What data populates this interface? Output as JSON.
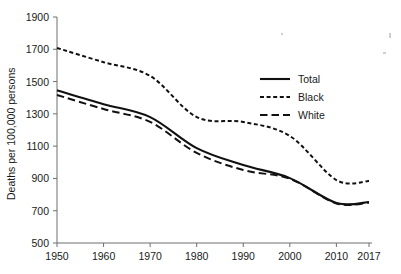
{
  "chart_data": {
    "type": "line",
    "title": "",
    "subtitle": "",
    "xlabel": "",
    "ylabel": "Deaths per 100,000 persons",
    "x": [
      1950,
      1960,
      1970,
      1980,
      1990,
      2000,
      2010,
      2017
    ],
    "xtick_labels": [
      "1950",
      "1960",
      "1970",
      "1980",
      "1990",
      "2000",
      "2010",
      "2017"
    ],
    "ytick_labels": [
      "500",
      "700",
      "900",
      "1100",
      "1300",
      "1500",
      "1700",
      "1900"
    ],
    "yticks": [
      500,
      700,
      900,
      1100,
      1300,
      1500,
      1700,
      1900
    ],
    "xlim": [
      1950,
      2017
    ],
    "ylim": [
      500,
      1900
    ],
    "grid": false,
    "legend_position": "upper-right",
    "series": [
      {
        "name": "Total",
        "style": "solid",
        "color": "#111111",
        "values": [
          1446,
          1360,
          1280,
          1088,
          983,
          902,
          748,
          754
        ]
      },
      {
        "name": "Black",
        "style": "fine-dashed",
        "color": "#111111",
        "values": [
          1708,
          1620,
          1535,
          1280,
          1250,
          1163,
          890,
          884
        ]
      },
      {
        "name": "White",
        "style": "long-dashed",
        "color": "#111111",
        "values": [
          1417,
          1330,
          1250,
          1058,
          952,
          898,
          745,
          750
        ]
      }
    ]
  },
  "legend": {
    "items": [
      {
        "label": "Total",
        "style": "solid"
      },
      {
        "label": "Black",
        "style": "fine-dashed"
      },
      {
        "label": "White",
        "style": "long-dashed"
      }
    ]
  }
}
